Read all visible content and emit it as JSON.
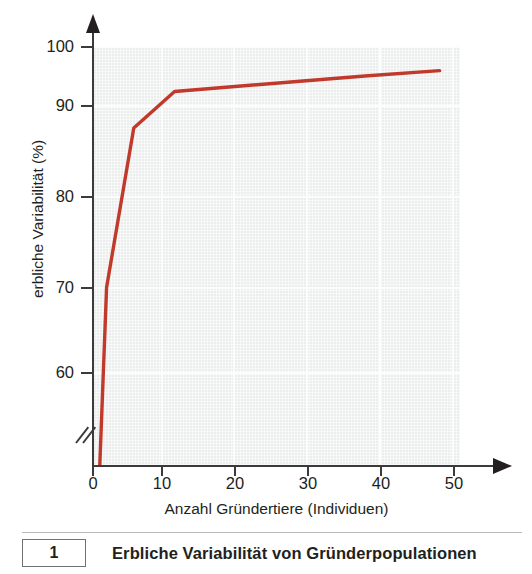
{
  "figure": {
    "caption_number": "1",
    "caption_text": "Erbliche Variabilität von Gründerpopulationen"
  },
  "chart_data": {
    "type": "line",
    "title": "Erbliche Variabilität von Gründerpopulationen",
    "xlabel": "Anzahl Gründertiere (Individuen)",
    "ylabel": "erbliche Variabilität (%)",
    "xlim": [
      0,
      54
    ],
    "ylim": [
      55,
      101
    ],
    "xticks": [
      0,
      10,
      20,
      30,
      40,
      50
    ],
    "xtick_labels": [
      "0",
      "10",
      "20",
      "30",
      "40",
      "50"
    ],
    "yticks": [
      60,
      70,
      80,
      90,
      100
    ],
    "ytick_labels": [
      "60",
      "70",
      "80",
      "90",
      "100"
    ],
    "y_axis_break": true,
    "grid": true,
    "legend": "none",
    "line_color": "#c0392b",
    "plot_background": "#eceded",
    "x": [
      1,
      2,
      6,
      12,
      20,
      30,
      40,
      51
    ],
    "y": [
      55,
      74.5,
      92,
      96,
      96.5,
      97.1,
      97.7,
      98.3
    ],
    "points": [
      {
        "x": 1,
        "y": 55
      },
      {
        "x": 2,
        "y": 74.5
      },
      {
        "x": 6,
        "y": 92
      },
      {
        "x": 12,
        "y": 96
      },
      {
        "x": 20,
        "y": 96.5
      },
      {
        "x": 30,
        "y": 97.1
      },
      {
        "x": 40,
        "y": 97.7
      },
      {
        "x": 51,
        "y": 98.3
      }
    ]
  }
}
